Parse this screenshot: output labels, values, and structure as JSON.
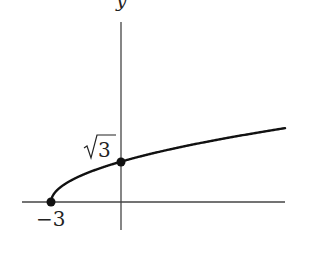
{
  "chart_data": {
    "type": "line",
    "title": "",
    "function": "y = sqrt(x + 3)",
    "xlabel": "",
    "ylabel": "y",
    "xlim": [
      -4.2,
      7.04
    ],
    "ylim": [
      -1.2,
      7.7
    ],
    "series": [
      {
        "name": "y = √(x+3)",
        "x": [
          -3,
          -2.75,
          -2.5,
          -2,
          -1,
          0,
          1,
          2,
          3,
          4,
          5,
          6,
          7
        ],
        "values": [
          0,
          0.5,
          0.707,
          1,
          1.414,
          1.732,
          2,
          2.236,
          2.449,
          2.646,
          2.828,
          3,
          3.162
        ]
      }
    ],
    "marked_points": [
      {
        "x": -3,
        "y": 0,
        "label": "−3"
      },
      {
        "x": 0,
        "y": 1.732,
        "label": "√3"
      }
    ],
    "grid": false,
    "legend": "none"
  },
  "labels": {
    "y_axis": "y",
    "x_intercept": "−3",
    "y_intercept_radicand": "3"
  },
  "colors": {
    "curve": "#111111",
    "axis": "#444444"
  }
}
